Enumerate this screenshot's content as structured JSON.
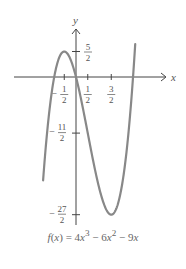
{
  "chart_data": {
    "type": "line",
    "title": "",
    "caption": "f(x) = 4x³ − 6x² − 9x",
    "function": {
      "a3": 4,
      "a2": -6,
      "a1": -9,
      "a0": 0
    },
    "x_domain": [
      -1.4,
      2.52
    ],
    "xlabel": "x",
    "ylabel": "y",
    "x_ticks": [
      {
        "value": -0.5,
        "num": "1",
        "den": "2",
        "sign": "−"
      },
      {
        "value": 0.5,
        "num": "1",
        "den": "2",
        "sign": ""
      },
      {
        "value": 1.5,
        "num": "3",
        "den": "2",
        "sign": ""
      }
    ],
    "y_ticks": [
      {
        "value": 2.5,
        "num": "5",
        "den": "2",
        "sign": ""
      },
      {
        "value": -5.5,
        "num": "11",
        "den": "2",
        "sign": "−"
      },
      {
        "value": -13.5,
        "num": "27",
        "den": "2",
        "sign": "−"
      }
    ],
    "grid": false,
    "colors": {
      "curve": "#888888",
      "axis": "#444444",
      "text": "#555555"
    }
  }
}
